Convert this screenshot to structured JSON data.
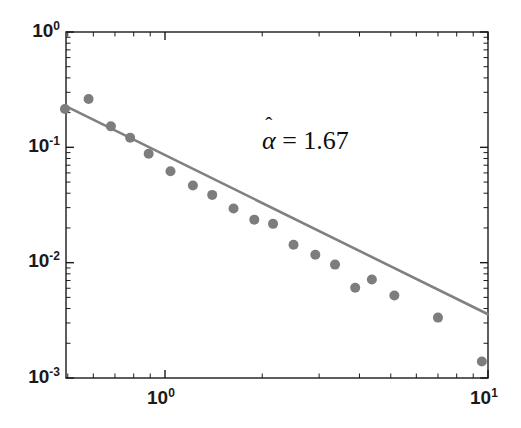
{
  "chart_data": {
    "type": "scatter",
    "title": "",
    "xlabel": "",
    "ylabel": "",
    "xscale": "log",
    "yscale": "log",
    "xlim": [
      0.49,
      10.0
    ],
    "ylim": [
      0.001,
      1.0
    ],
    "grid": false,
    "legend": null,
    "x_major_ticks": [
      1.0,
      10.0
    ],
    "x_major_tick_labels": [
      "10",
      "10"
    ],
    "x_major_tick_exponents": [
      "0",
      "1"
    ],
    "y_major_ticks": [
      1.0,
      0.1,
      0.01,
      0.001
    ],
    "y_major_tick_labels": [
      "10",
      "10",
      "10",
      "10"
    ],
    "y_major_tick_exponents": [
      "0",
      "-1",
      "-2",
      "-3"
    ],
    "series": [
      {
        "name": "data",
        "type": "scatter",
        "marker": "circle",
        "marker_color": "#7d7d7d",
        "marker_size": 10,
        "x": [
          0.49,
          0.58,
          0.68,
          0.78,
          0.89,
          1.04,
          1.22,
          1.4,
          1.63,
          1.89,
          2.16,
          2.5,
          2.92,
          3.36,
          4.37,
          3.88,
          5.13,
          7.0,
          9.57
        ],
        "y": [
          0.215,
          0.262,
          0.152,
          0.121,
          0.088,
          0.062,
          0.0466,
          0.0387,
          0.0295,
          0.0236,
          0.0217,
          0.0143,
          0.0117,
          0.00962,
          0.00714,
          0.00605,
          0.00519,
          0.00334,
          0.00139
        ]
      },
      {
        "name": "power-law fit",
        "type": "line",
        "line_color": "#808080",
        "line_width": 2.6,
        "slope": -1.67,
        "x": [
          0.493,
          10.0
        ],
        "y": [
          0.2274,
          0.00357
        ]
      }
    ],
    "annotations": [
      {
        "name": "alpha-estimate",
        "symbol": "α",
        "accent": "̂",
        "equals": "=",
        "value": "1.67",
        "text": "α̂ = 1.67",
        "x_px": 262,
        "y_px": 128
      }
    ]
  },
  "axes": {
    "frame_color": "#1a1a1a",
    "tick_color": "#1a1a1a",
    "y_tick_labels": [
      {
        "mantissa": "10",
        "exponent": "0",
        "top_px": 21
      },
      {
        "mantissa": "10",
        "exponent": "-1",
        "top_px": 136
      },
      {
        "mantissa": "10",
        "exponent": "-2",
        "top_px": 251
      },
      {
        "mantissa": "10",
        "exponent": "-3",
        "top_px": 367
      }
    ],
    "x_tick_labels": [
      {
        "mantissa": "10",
        "exponent": "0",
        "left_px": 147
      },
      {
        "mantissa": "10",
        "exponent": "1",
        "left_px": 470
      }
    ]
  },
  "colors": {
    "background": "#ffffff",
    "marker": "#7d7d7d",
    "fit_line": "#808080",
    "axis": "#1a1a1a",
    "text": "#0d0d0d"
  }
}
